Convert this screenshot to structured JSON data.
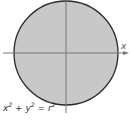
{
  "diagram": {
    "x_axis_label": "x",
    "equation": {
      "x_term": "x",
      "y_term": "y",
      "r_term": "r",
      "exponent": "2",
      "plus": "+",
      "equals": "="
    },
    "colors": {
      "fill": "#c8c8c8",
      "stroke": "#2a2a2a",
      "axis": "#777777"
    }
  }
}
